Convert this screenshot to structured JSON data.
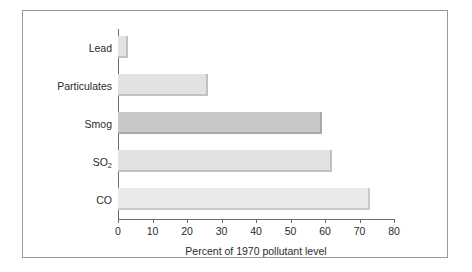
{
  "chart_data": {
    "type": "bar",
    "orientation": "horizontal",
    "title": "",
    "xlabel": "Percent of 1970 pollutant level",
    "ylabel": "",
    "xlim": [
      0,
      80
    ],
    "xticks": [
      0,
      10,
      20,
      30,
      40,
      50,
      60,
      70,
      80
    ],
    "grid": false,
    "legend": null,
    "categories": [
      "Lead",
      "Particulates",
      "Smog",
      "SO2",
      "CO"
    ],
    "category_labels_html": [
      "Lead",
      "Particulates",
      "Smog",
      "SO",
      "CO"
    ],
    "values": [
      3,
      26,
      59,
      62,
      73
    ],
    "bars": [
      {
        "label": "Lead",
        "value": 3,
        "shade": "mid"
      },
      {
        "label": "Particulates",
        "value": 26,
        "shade": "mid"
      },
      {
        "label": "Smog",
        "value": 59,
        "shade": "dark"
      },
      {
        "label": "SO2",
        "value": 62,
        "shade": "mid"
      },
      {
        "label": "CO",
        "value": 73,
        "shade": "light"
      }
    ],
    "colors": {
      "bar_light": "#eaeaea",
      "bar_mid": "#e2e2e2",
      "bar_dark": "#c8c8c8",
      "axis": "#6e6e6e",
      "border": "#9a9a9a",
      "text": "#2b2b2b",
      "background": "#ffffff"
    }
  },
  "axis": {
    "so2_base": "SO",
    "so2_sub": "2"
  }
}
